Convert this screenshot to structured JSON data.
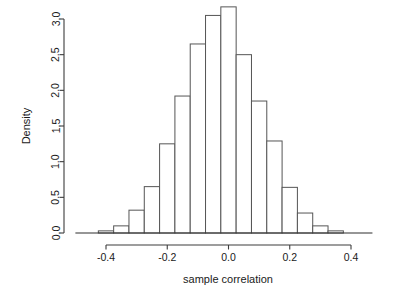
{
  "chart_data": {
    "type": "bar",
    "subtype": "histogram",
    "title": "",
    "xlabel": "sample correlation",
    "ylabel": "Density",
    "xlim": [
      -0.5,
      0.47
    ],
    "ylim": [
      0.0,
      3.3
    ],
    "xticks": [
      -0.4,
      -0.2,
      0.0,
      0.2,
      0.4
    ],
    "xtick_labels": [
      "-0.4",
      "-0.2",
      "0.0",
      "0.2",
      "0.4"
    ],
    "yticks": [
      0.0,
      0.5,
      1.0,
      1.5,
      2.0,
      2.5,
      3.0
    ],
    "ytick_labels": [
      "0.0",
      "0.5",
      "1.0",
      "1.5",
      "2.0",
      "2.5",
      "3.0"
    ],
    "grid": false,
    "legend": false,
    "bin_width": 0.05,
    "bin_edges": [
      -0.425,
      -0.375,
      -0.325,
      -0.275,
      -0.225,
      -0.175,
      -0.125,
      -0.075,
      -0.025,
      0.025,
      0.075,
      0.125,
      0.175,
      0.225,
      0.275,
      0.325,
      0.375
    ],
    "bin_centers": [
      -0.4,
      -0.35,
      -0.3,
      -0.25,
      -0.2,
      -0.15,
      -0.1,
      -0.05,
      0.0,
      0.05,
      0.1,
      0.15,
      0.2,
      0.25,
      0.3,
      0.35
    ],
    "categories": [
      "-0.40",
      "-0.35",
      "-0.30",
      "-0.25",
      "-0.20",
      "-0.15",
      "-0.10",
      "-0.05",
      "0.00",
      "0.05",
      "0.10",
      "0.15",
      "0.20",
      "0.25",
      "0.30",
      "0.35"
    ],
    "values": [
      0.03,
      0.1,
      0.32,
      0.65,
      1.25,
      1.92,
      2.65,
      3.05,
      3.17,
      2.5,
      1.85,
      1.29,
      0.64,
      0.28,
      0.1,
      0.03
    ],
    "bar_fill_color": "#ffffff",
    "bar_edge_color": "#555555",
    "axis_color": "#3c3c3c",
    "background_color": "#ffffff"
  }
}
